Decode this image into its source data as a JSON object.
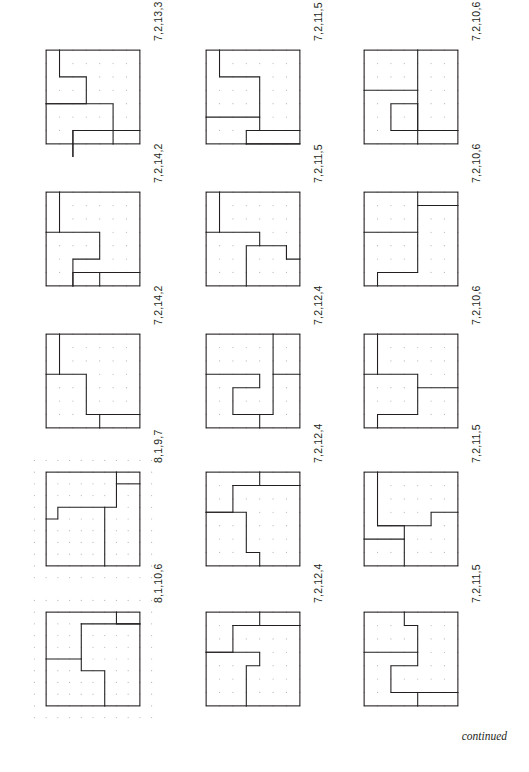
{
  "page": {
    "footer_note": "continued",
    "stroke_color": "#231f20",
    "dot_color": "#b9b9b9",
    "background": "#ffffff"
  },
  "figures": [
    {
      "id": "fig-r1c1",
      "label": "7,2,13,3",
      "grid": 7,
      "pieces": 4,
      "cuts": [
        {
          "type": "path",
          "points": [
            [
              1,
              0
            ],
            [
              1,
              2
            ],
            [
              3,
              2
            ],
            [
              3,
              4
            ],
            [
              0,
              4
            ]
          ]
        },
        {
          "type": "path",
          "points": [
            [
              0,
              4
            ],
            [
              5,
              4
            ],
            [
              5,
              6
            ],
            [
              2,
              6
            ],
            [
              2,
              8
            ]
          ]
        },
        {
          "type": "path",
          "points": [
            [
              2,
              8
            ],
            [
              2,
              6
            ],
            [
              7,
              6
            ]
          ]
        },
        {
          "type": "path",
          "points": [
            [
              5,
              6
            ],
            [
              5,
              7
            ]
          ]
        }
      ]
    },
    {
      "id": "fig-r1c2",
      "label": "7,2,11,5",
      "grid": 7,
      "pieces": 4,
      "cuts": [
        {
          "type": "path",
          "points": [
            [
              1,
              0
            ],
            [
              1,
              2
            ],
            [
              4,
              2
            ],
            [
              4,
              6
            ],
            [
              3,
              6
            ],
            [
              3,
              7
            ]
          ]
        },
        {
          "type": "path",
          "points": [
            [
              0,
              5
            ],
            [
              4,
              5
            ]
          ]
        },
        {
          "type": "path",
          "points": [
            [
              3,
              7
            ],
            [
              7,
              7
            ]
          ]
        },
        {
          "type": "path",
          "points": [
            [
              4,
              6
            ],
            [
              7,
              6
            ]
          ]
        }
      ]
    },
    {
      "id": "fig-r1c3",
      "label": "7,2,10,6",
      "grid": 7,
      "pieces": 4,
      "cuts": [
        {
          "type": "path",
          "points": [
            [
              4,
              0
            ],
            [
              4,
              7
            ]
          ]
        },
        {
          "type": "path",
          "points": [
            [
              0,
              3
            ],
            [
              4,
              3
            ]
          ]
        },
        {
          "type": "path",
          "points": [
            [
              4,
              4
            ],
            [
              2,
              4
            ],
            [
              2,
              6
            ],
            [
              7,
              6
            ]
          ]
        },
        {
          "type": "path",
          "points": [
            [
              4,
              4
            ],
            [
              4,
              6
            ]
          ]
        }
      ]
    },
    {
      "id": "fig-r2c1",
      "label": "7,2,14,2",
      "grid": 7,
      "pieces": 4,
      "cuts": [
        {
          "type": "path",
          "points": [
            [
              1,
              0
            ],
            [
              1,
              3
            ],
            [
              0,
              3
            ]
          ]
        },
        {
          "type": "path",
          "points": [
            [
              1,
              3
            ],
            [
              4,
              3
            ],
            [
              4,
              5
            ],
            [
              2,
              5
            ],
            [
              2,
              7
            ]
          ]
        },
        {
          "type": "path",
          "points": [
            [
              2,
              7
            ],
            [
              2,
              6
            ],
            [
              7,
              6
            ]
          ]
        },
        {
          "type": "path",
          "points": [
            [
              4,
              6
            ],
            [
              4,
              7
            ]
          ]
        }
      ]
    },
    {
      "id": "fig-r2c2",
      "label": "7,2,11,5",
      "grid": 7,
      "pieces": 4,
      "cuts": [
        {
          "type": "path",
          "points": [
            [
              1,
              0
            ],
            [
              1,
              3
            ],
            [
              0,
              3
            ]
          ]
        },
        {
          "type": "path",
          "points": [
            [
              1,
              3
            ],
            [
              4,
              3
            ],
            [
              4,
              4
            ],
            [
              6,
              4
            ],
            [
              6,
              5
            ],
            [
              7,
              5
            ]
          ]
        },
        {
          "type": "path",
          "points": [
            [
              4,
              4
            ],
            [
              3,
              4
            ],
            [
              3,
              7
            ]
          ]
        },
        {
          "type": "path",
          "points": [
            [
              6,
              4
            ],
            [
              6,
              5
            ]
          ]
        }
      ]
    },
    {
      "id": "fig-r2c3",
      "label": "7,2,10,6",
      "grid": 7,
      "pieces": 4,
      "cuts": [
        {
          "type": "path",
          "points": [
            [
              4,
              0
            ],
            [
              4,
              6
            ],
            [
              1,
              6
            ],
            [
              1,
              7
            ]
          ]
        },
        {
          "type": "path",
          "points": [
            [
              0,
              3
            ],
            [
              4,
              3
            ]
          ]
        },
        {
          "type": "path",
          "points": [
            [
              4,
              1
            ],
            [
              7,
              1
            ]
          ]
        }
      ]
    },
    {
      "id": "fig-r3c1",
      "label": "7,2,14,2",
      "grid": 7,
      "pieces": 4,
      "cuts": [
        {
          "type": "path",
          "points": [
            [
              1,
              0
            ],
            [
              1,
              3
            ],
            [
              0,
              3
            ]
          ]
        },
        {
          "type": "path",
          "points": [
            [
              1,
              3
            ],
            [
              3,
              3
            ],
            [
              3,
              6
            ],
            [
              7,
              6
            ]
          ]
        },
        {
          "type": "path",
          "points": [
            [
              4,
              6
            ],
            [
              4,
              7
            ]
          ]
        }
      ]
    },
    {
      "id": "fig-r3c2",
      "label": "7,2,12,4",
      "grid": 7,
      "pieces": 4,
      "cuts": [
        {
          "type": "path",
          "points": [
            [
              5,
              0
            ],
            [
              5,
              3
            ],
            [
              7,
              3
            ]
          ]
        },
        {
          "type": "path",
          "points": [
            [
              0,
              3
            ],
            [
              4,
              3
            ],
            [
              4,
              4
            ],
            [
              2,
              4
            ],
            [
              2,
              6
            ],
            [
              5,
              6
            ],
            [
              5,
              3
            ]
          ]
        },
        {
          "type": "path",
          "points": [
            [
              4,
              6
            ],
            [
              4,
              7
            ]
          ]
        }
      ]
    },
    {
      "id": "fig-r3c3",
      "label": "7,2,10,6",
      "grid": 7,
      "pieces": 4,
      "cuts": [
        {
          "type": "path",
          "points": [
            [
              1,
              0
            ],
            [
              1,
              3
            ],
            [
              0,
              3
            ]
          ]
        },
        {
          "type": "path",
          "points": [
            [
              1,
              3
            ],
            [
              4,
              3
            ],
            [
              4,
              6
            ],
            [
              1,
              6
            ],
            [
              1,
              7
            ]
          ]
        },
        {
          "type": "path",
          "points": [
            [
              4,
              4
            ],
            [
              7,
              4
            ]
          ]
        }
      ]
    },
    {
      "id": "fig-r4c1",
      "label": "8,1,9,7",
      "grid": 8,
      "pieces": 4,
      "cuts": [
        {
          "type": "path",
          "points": [
            [
              6,
              0
            ],
            [
              6,
              3
            ],
            [
              1,
              3
            ],
            [
              1,
              4
            ],
            [
              0,
              4
            ]
          ]
        },
        {
          "type": "path",
          "points": [
            [
              6,
              1
            ],
            [
              8,
              1
            ]
          ]
        },
        {
          "type": "path",
          "points": [
            [
              5,
              3
            ],
            [
              5,
              8
            ]
          ]
        }
      ]
    },
    {
      "id": "fig-r4c2",
      "label": "7,2,12,4",
      "grid": 7,
      "pieces": 4,
      "cuts": [
        {
          "type": "path",
          "points": [
            [
              4,
              0
            ],
            [
              4,
              1
            ],
            [
              7,
              1
            ]
          ]
        },
        {
          "type": "path",
          "points": [
            [
              2,
              1
            ],
            [
              2,
              3
            ],
            [
              0,
              3
            ]
          ]
        },
        {
          "type": "path",
          "points": [
            [
              2,
              1
            ],
            [
              7,
              1
            ]
          ]
        },
        {
          "type": "path",
          "points": [
            [
              0,
              3
            ],
            [
              3,
              3
            ],
            [
              3,
              6
            ],
            [
              4,
              6
            ],
            [
              4,
              7
            ]
          ]
        }
      ]
    },
    {
      "id": "fig-r4c3",
      "label": "7,2,11,5",
      "grid": 7,
      "pieces": 4,
      "cuts": [
        {
          "type": "path",
          "points": [
            [
              1,
              0
            ],
            [
              1,
              4
            ],
            [
              3,
              4
            ],
            [
              3,
              7
            ]
          ]
        },
        {
          "type": "path",
          "points": [
            [
              1,
              4
            ],
            [
              5,
              4
            ],
            [
              5,
              3
            ],
            [
              7,
              3
            ]
          ]
        },
        {
          "type": "path",
          "points": [
            [
              0,
              5
            ],
            [
              3,
              5
            ]
          ]
        }
      ]
    },
    {
      "id": "fig-r5c1",
      "label": "8,1,10,6",
      "grid": 8,
      "pieces": 4,
      "cuts": [
        {
          "type": "path",
          "points": [
            [
              6,
              0
            ],
            [
              6,
              1
            ],
            [
              8,
              1
            ]
          ]
        },
        {
          "type": "path",
          "points": [
            [
              3,
              1
            ],
            [
              3,
              4
            ],
            [
              0,
              4
            ]
          ]
        },
        {
          "type": "path",
          "points": [
            [
              3,
              1
            ],
            [
              8,
              1
            ]
          ]
        },
        {
          "type": "path",
          "points": [
            [
              3,
              4
            ],
            [
              3,
              5
            ],
            [
              5,
              5
            ],
            [
              5,
              8
            ]
          ]
        }
      ]
    },
    {
      "id": "fig-r5c2",
      "label": "7,2,12,4",
      "grid": 7,
      "pieces": 4,
      "cuts": [
        {
          "type": "path",
          "points": [
            [
              4,
              0
            ],
            [
              4,
              1
            ],
            [
              7,
              1
            ]
          ]
        },
        {
          "type": "path",
          "points": [
            [
              2,
              1
            ],
            [
              2,
              3
            ],
            [
              0,
              3
            ]
          ]
        },
        {
          "type": "path",
          "points": [
            [
              2,
              1
            ],
            [
              7,
              1
            ]
          ]
        },
        {
          "type": "path",
          "points": [
            [
              0,
              3
            ],
            [
              4,
              3
            ],
            [
              4,
              4
            ],
            [
              3,
              4
            ],
            [
              3,
              7
            ]
          ]
        }
      ]
    },
    {
      "id": "fig-r5c3",
      "label": "7,2,11,5",
      "grid": 7,
      "pieces": 4,
      "cuts": [
        {
          "type": "path",
          "points": [
            [
              3,
              0
            ],
            [
              3,
              1
            ],
            [
              4,
              1
            ],
            [
              4,
              3
            ],
            [
              0,
              3
            ]
          ]
        },
        {
          "type": "path",
          "points": [
            [
              4,
              3
            ],
            [
              4,
              4
            ],
            [
              2,
              4
            ],
            [
              2,
              6
            ],
            [
              7,
              6
            ]
          ]
        },
        {
          "type": "path",
          "points": [
            [
              4,
              6
            ],
            [
              4,
              7
            ]
          ]
        }
      ]
    }
  ]
}
